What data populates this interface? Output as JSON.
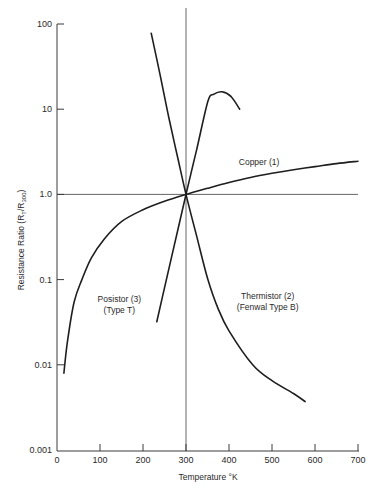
{
  "chart_data": {
    "type": "line",
    "title": "",
    "xlabel": "Temperature °K",
    "ylabel": "Resistance Ratio (R_T/R_300)",
    "ylabel_parts": {
      "main": "Resistance Ratio  (R",
      "sub1": "T",
      "mid": "/R",
      "sub2": "300",
      "end": ")"
    },
    "xscale": "linear",
    "yscale": "log",
    "xlim": [
      0,
      700
    ],
    "ylim": [
      0.001,
      100
    ],
    "x_ticks": [
      0,
      100,
      200,
      300,
      400,
      500,
      600,
      700
    ],
    "x_tick_labels": [
      "0",
      "100",
      "200",
      "300",
      "400",
      "500",
      "600",
      "700"
    ],
    "y_ticks": [
      0.001,
      0.01,
      0.1,
      1,
      10,
      100
    ],
    "y_tick_labels": [
      "0.001",
      "0.01",
      "0.1",
      "1.0",
      "10",
      "100"
    ],
    "grid": false,
    "reference_lines": [
      {
        "orientation": "vertical",
        "x": 300
      },
      {
        "orientation": "horizontal",
        "y": 1.0
      }
    ],
    "legend": "none (inline annotations)",
    "series": [
      {
        "name": "Copper (1)",
        "label_lines": [
          "Copper (1)"
        ],
        "label_pos": {
          "x": 470,
          "y": 2.2
        },
        "points": [
          [
            16,
            0.008
          ],
          [
            25,
            0.02
          ],
          [
            40,
            0.055
          ],
          [
            58,
            0.1
          ],
          [
            80,
            0.18
          ],
          [
            110,
            0.3
          ],
          [
            150,
            0.48
          ],
          [
            200,
            0.66
          ],
          [
            250,
            0.83
          ],
          [
            300,
            1.0
          ],
          [
            350,
            1.18
          ],
          [
            400,
            1.38
          ],
          [
            450,
            1.58
          ],
          [
            500,
            1.77
          ],
          [
            550,
            1.95
          ],
          [
            600,
            2.12
          ],
          [
            650,
            2.3
          ],
          [
            700,
            2.45
          ]
        ]
      },
      {
        "name": "Thermistor (2) (Fenwal Type B)",
        "label_lines": [
          "Thermistor (2)",
          "(Fenwal Type B)"
        ],
        "label_pos": {
          "x": 490,
          "y": 0.06
        },
        "points": [
          [
            219,
            78
          ],
          [
            240,
            25
          ],
          [
            260,
            8
          ],
          [
            280,
            2.8
          ],
          [
            300,
            1.0
          ],
          [
            325,
            0.32
          ],
          [
            351,
            0.1
          ],
          [
            375,
            0.045
          ],
          [
            400,
            0.025
          ],
          [
            455,
            0.01
          ],
          [
            500,
            0.0065
          ],
          [
            550,
            0.0046
          ],
          [
            577,
            0.0037
          ]
        ]
      },
      {
        "name": "Posistor (3) (Type T)",
        "label_lines": [
          "Posistor (3)",
          "(Type T)"
        ],
        "label_pos": {
          "x": 145,
          "y": 0.055
        },
        "points": [
          [
            232,
            0.032
          ],
          [
            250,
            0.08
          ],
          [
            270,
            0.22
          ],
          [
            300,
            1.0
          ],
          [
            325,
            3.4
          ],
          [
            351,
            12.4
          ],
          [
            365,
            15
          ],
          [
            384,
            16
          ],
          [
            405,
            14
          ],
          [
            425,
            10
          ]
        ]
      }
    ]
  }
}
